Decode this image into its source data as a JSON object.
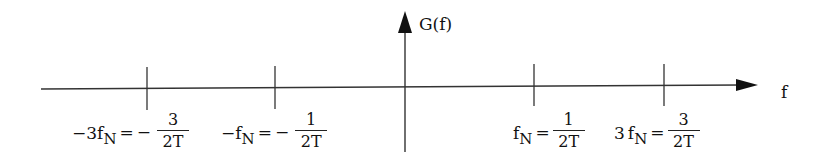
{
  "diagram": {
    "vertical_axis": {
      "label": "G(f)"
    },
    "horizontal_axis": {
      "label": "f"
    },
    "ticks": [
      {
        "name": "minus-3fN",
        "lhs_sign": "−",
        "lhs_coef": "3",
        "lhs_var": "f",
        "lhs_sub": "N",
        "eq": "=",
        "rhs_sign": "−",
        "num": "3",
        "den": "2T"
      },
      {
        "name": "minus-fN",
        "lhs_sign": "−",
        "lhs_coef": "",
        "lhs_var": "f",
        "lhs_sub": "N",
        "eq": "=",
        "rhs_sign": "−",
        "num": "1",
        "den": "2T"
      },
      {
        "name": "fN",
        "lhs_sign": "",
        "lhs_coef": "",
        "lhs_var": "f",
        "lhs_sub": "N",
        "eq": "=",
        "rhs_sign": "",
        "num": "1",
        "den": "2T"
      },
      {
        "name": "3fN",
        "lhs_sign": "",
        "lhs_coef": "3",
        "lhs_var": "f",
        "lhs_sub": "N",
        "eq": "=",
        "rhs_sign": "",
        "num": "3",
        "den": "2T"
      }
    ],
    "colors": {
      "line": "#222222",
      "text": "#111111",
      "background": "#ffffff"
    }
  }
}
